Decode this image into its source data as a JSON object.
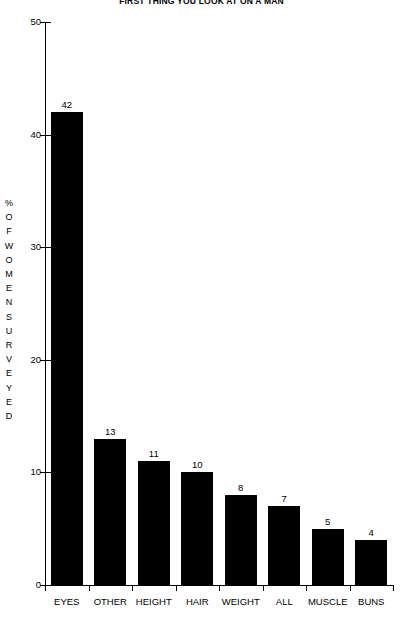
{
  "chart_data": {
    "type": "bar",
    "title": "FIRST THING YOU LOOK AT ON A MAN",
    "xlabel": "",
    "ylabel": "% OF WOMEN SURVEYED",
    "ylim": [
      0,
      50
    ],
    "ytick_values": [
      0,
      10,
      20,
      30,
      40,
      50
    ],
    "ytick_labels": [
      "0",
      "10",
      "20",
      "30",
      "40",
      "50"
    ],
    "grid": false,
    "legend": "none",
    "categories": [
      "EYES",
      "OTHER",
      "HEIGHT",
      "HAIR",
      "WEIGHT",
      "ALL",
      "MUSCLE",
      "BUNS"
    ],
    "values": [
      42,
      13,
      11,
      10,
      8,
      7,
      5,
      4
    ],
    "value_labels": [
      "42",
      "13",
      "11",
      "10",
      "8",
      "7",
      "5",
      "4"
    ],
    "bar_color": "#000000",
    "axis_color": "#000000",
    "background_color": "#ffffff"
  },
  "y_axis_title_letters": [
    "%",
    "O",
    "F",
    "W",
    "O",
    "M",
    "E",
    "N",
    "S",
    "U",
    "R",
    "V",
    "E",
    "Y",
    "E",
    "D"
  ]
}
